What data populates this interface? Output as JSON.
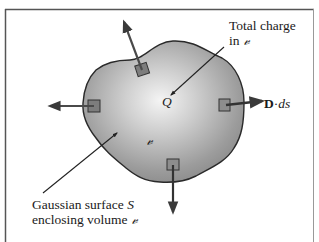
{
  "figure": {
    "labels": {
      "total_charge_line1": "Total charge",
      "total_charge_line2_prefix": "in ",
      "volume_symbol": "𝓋",
      "charge_symbol": "Q",
      "flux_vector": "D",
      "flux_dot": "·",
      "flux_element": "ds",
      "surface_line1_prefix": "Gaussian surface ",
      "surface_symbol": "S",
      "surface_line2_prefix": "enclosing volume "
    },
    "elements": {
      "surface": "Gaussian surface S (closed irregular surface, shaded)",
      "surface_elements": [
        "top",
        "left",
        "right",
        "bottom"
      ],
      "flux_arrows": [
        "outward-top",
        "outward-left",
        "outward-right",
        "outward-bottom"
      ]
    },
    "colors": {
      "frame": "#555555",
      "surface_fill_dark": "#8a8a8a",
      "surface_fill_light": "#efefef",
      "outline": "#2a2a2a"
    }
  }
}
